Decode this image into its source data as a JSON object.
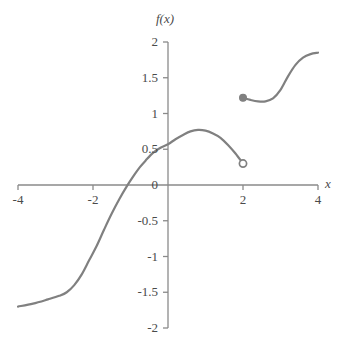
{
  "chart_data": {
    "type": "line",
    "title": "",
    "xlabel": "x",
    "ylabel": "f(x)",
    "xlim": [
      -4,
      4
    ],
    "ylim": [
      -2,
      2
    ],
    "grid": false,
    "legend": "none",
    "line_color": "#808080",
    "axis_color": "#8a8a8a",
    "text_color": "#4a4a4a",
    "xticks": [
      -4,
      -2,
      2,
      4
    ],
    "xtick_labels": [
      "-4",
      "-2",
      "2",
      "4"
    ],
    "yticks": [
      -2,
      -1.5,
      -1,
      -0.5,
      0,
      0.5,
      1,
      1.5,
      2
    ],
    "ytick_labels": [
      "-2",
      "-1.5",
      "-1",
      "-0.5",
      "0",
      "0.5",
      "1",
      "1.5",
      "2"
    ],
    "series": [
      {
        "name": "left-branch",
        "style": "solid",
        "points": [
          [
            -4.0,
            -1.7
          ],
          [
            -3.6,
            -1.66
          ],
          [
            -3.2,
            -1.6
          ],
          [
            -2.9,
            -1.55
          ],
          [
            -2.7,
            -1.5
          ],
          [
            -2.5,
            -1.4
          ],
          [
            -2.3,
            -1.25
          ],
          [
            -2.1,
            -1.05
          ],
          [
            -1.9,
            -0.85
          ],
          [
            -1.7,
            -0.62
          ],
          [
            -1.5,
            -0.4
          ],
          [
            -1.3,
            -0.2
          ],
          [
            -1.1,
            -0.02
          ],
          [
            -0.9,
            0.14
          ],
          [
            -0.75,
            0.25
          ],
          [
            -0.6,
            0.34
          ],
          [
            -0.4,
            0.45
          ],
          [
            -0.2,
            0.52
          ],
          [
            0.0,
            0.57
          ],
          [
            0.2,
            0.64
          ],
          [
            0.4,
            0.7
          ],
          [
            0.6,
            0.75
          ],
          [
            0.8,
            0.77
          ],
          [
            1.0,
            0.76
          ],
          [
            1.2,
            0.72
          ],
          [
            1.4,
            0.66
          ],
          [
            1.6,
            0.56
          ],
          [
            1.8,
            0.44
          ],
          [
            2.0,
            0.3
          ]
        ]
      },
      {
        "name": "right-branch",
        "style": "solid",
        "points": [
          [
            2.0,
            1.22
          ],
          [
            2.2,
            1.19
          ],
          [
            2.4,
            1.17
          ],
          [
            2.6,
            1.17
          ],
          [
            2.8,
            1.21
          ],
          [
            3.0,
            1.33
          ],
          [
            3.2,
            1.52
          ],
          [
            3.4,
            1.68
          ],
          [
            3.6,
            1.78
          ],
          [
            3.8,
            1.83
          ],
          [
            4.0,
            1.85
          ]
        ]
      }
    ],
    "markers": [
      {
        "name": "open-endpoint",
        "x": 2.0,
        "y": 0.3,
        "fill": "open"
      },
      {
        "name": "closed-endpoint",
        "x": 2.0,
        "y": 1.22,
        "fill": "closed"
      }
    ]
  }
}
